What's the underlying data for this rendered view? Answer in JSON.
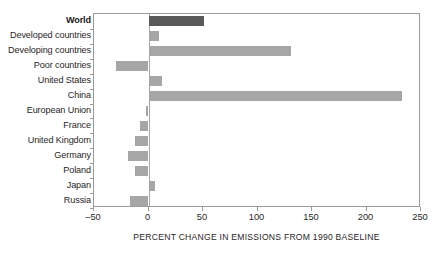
{
  "chart_data": {
    "type": "bar",
    "orientation": "horizontal",
    "title": "",
    "subtitle": "",
    "xlabel": "PERCENT CHANGE IN EMISSIONS FROM 1990 BASELINE",
    "ylabel": "",
    "xlim": [
      -50,
      250
    ],
    "ylim": null,
    "xticks": [
      -50,
      0,
      50,
      100,
      150,
      200,
      250
    ],
    "xtick_labels": [
      "–50",
      "0",
      "50",
      "100",
      "150",
      "200",
      "250"
    ],
    "grid": false,
    "legend": null,
    "zero_reference_line": 0,
    "categories": [
      "World",
      "Developed countries",
      "Developing countries",
      "Poor countries",
      "United States",
      "China",
      "European Union",
      "France",
      "United Kingdom",
      "Germany",
      "Poland",
      "Japan",
      "Russia"
    ],
    "values": [
      51,
      10,
      131,
      -30,
      12,
      233,
      -2,
      -8,
      -12,
      -19,
      -12,
      6,
      -17
    ],
    "highlight_category": "World",
    "colors": {
      "highlight_bar": "#595959",
      "bar": "#a6a6a6",
      "frame": "#9a9a9a",
      "zero_line": "#a8a8a8",
      "text": "#2a2627",
      "background": "#ffffff"
    }
  }
}
